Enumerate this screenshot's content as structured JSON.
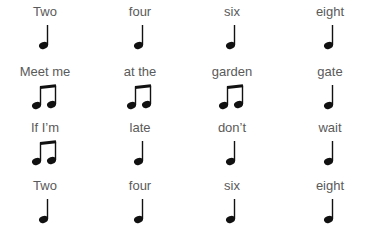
{
  "colors": {
    "text": "#5a5a5a",
    "note": "#111111",
    "background": "#ffffff"
  },
  "rows": [
    {
      "cells": [
        {
          "word": "Two",
          "note": "quarter-note"
        },
        {
          "word": "four",
          "note": "quarter-note"
        },
        {
          "word": "six",
          "note": "quarter-note"
        },
        {
          "word": "eight",
          "note": "quarter-note"
        }
      ]
    },
    {
      "cells": [
        {
          "word": "Meet me",
          "note": "beamed-eighth-notes"
        },
        {
          "word": "at the",
          "note": "beamed-eighth-notes"
        },
        {
          "word": "garden",
          "note": "beamed-eighth-notes"
        },
        {
          "word": "gate",
          "note": "quarter-note"
        }
      ]
    },
    {
      "cells": [
        {
          "word": "If I’m",
          "note": "beamed-eighth-notes"
        },
        {
          "word": "late",
          "note": "quarter-note"
        },
        {
          "word": "don’t",
          "note": "quarter-note"
        },
        {
          "word": "wait",
          "note": "quarter-note"
        }
      ]
    },
    {
      "cells": [
        {
          "word": "Two",
          "note": "quarter-note"
        },
        {
          "word": "four",
          "note": "quarter-note"
        },
        {
          "word": "six",
          "note": "quarter-note"
        },
        {
          "word": "eight",
          "note": "quarter-note"
        }
      ]
    }
  ]
}
